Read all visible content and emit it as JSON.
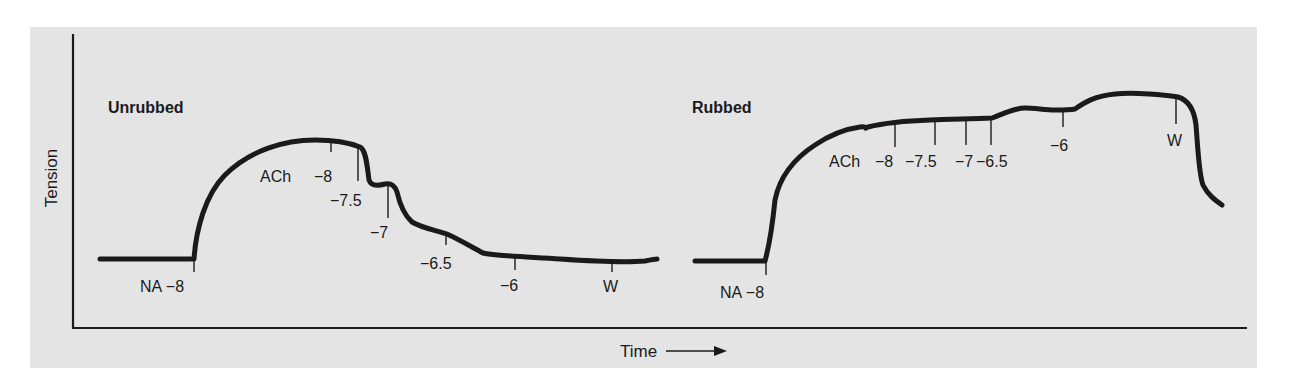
{
  "figure": {
    "y_axis_label": "Tension",
    "x_axis_label": "Time",
    "x_axis_arrow": "right-arrow-icon",
    "colors": {
      "panel_background": "#e4e4e4",
      "trace": "#1a1a1a",
      "page_background": "#ffffff"
    }
  },
  "panels": [
    {
      "title": "Unrubbed",
      "markers": [
        {
          "label": "NA −8",
          "type": "noradrenaline"
        },
        {
          "label": "ACh",
          "type": "acetylcholine-start"
        },
        {
          "label": "−8"
        },
        {
          "label": "−7.5"
        },
        {
          "label": "−7"
        },
        {
          "label": "−6.5"
        },
        {
          "label": "−6"
        },
        {
          "label": "W",
          "type": "wash"
        }
      ]
    },
    {
      "title": "Rubbed",
      "markers": [
        {
          "label": "NA −8",
          "type": "noradrenaline"
        },
        {
          "label": "ACh",
          "type": "acetylcholine-start"
        },
        {
          "label": "−8"
        },
        {
          "label": "−7.5"
        },
        {
          "label": "−7"
        },
        {
          "label": "−6.5"
        },
        {
          "label": "−6"
        },
        {
          "label": "W",
          "type": "wash"
        }
      ]
    }
  ]
}
